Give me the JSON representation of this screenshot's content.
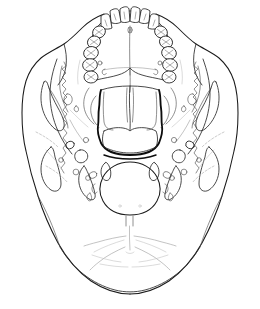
{
  "figure": {
    "title": "Human skull, inferior (basal) view",
    "view": "inferior",
    "style": "line-drawing",
    "background_color": "#ffffff",
    "line_color": "#1a1a1a",
    "accent_line_color": "#0d0d0d",
    "faint_line_color": "#9a9a9a",
    "width_px": 260,
    "height_px": 309,
    "labels_present": false,
    "caption": ""
  },
  "regions": [
    {
      "id": "dental-arch",
      "name": "Maxillary dental arch"
    },
    {
      "id": "hard-palate",
      "name": "Hard palate"
    },
    {
      "id": "choanae",
      "name": "Posterior nasal apertures (choanae)"
    },
    {
      "id": "vomer",
      "name": "Vomer"
    },
    {
      "id": "left-temporal",
      "name": "Left temporal region"
    },
    {
      "id": "right-temporal",
      "name": "Right temporal region"
    },
    {
      "id": "foramen-magnum",
      "name": "Foramen magnum"
    },
    {
      "id": "occipital-condyles",
      "name": "Occipital condyles"
    },
    {
      "id": "occipital-squama",
      "name": "Occipital squama with nuchal lines"
    }
  ],
  "dentition": {
    "arch": "maxillary",
    "total_teeth": 16,
    "left_quadrant": [
      {
        "position": 1,
        "name": "central incisor"
      },
      {
        "position": 2,
        "name": "lateral incisor"
      },
      {
        "position": 3,
        "name": "canine"
      },
      {
        "position": 4,
        "name": "first premolar"
      },
      {
        "position": 5,
        "name": "second premolar"
      },
      {
        "position": 6,
        "name": "first molar"
      },
      {
        "position": 7,
        "name": "second molar"
      },
      {
        "position": 8,
        "name": "third molar"
      }
    ],
    "right_quadrant": [
      {
        "position": 1,
        "name": "central incisor"
      },
      {
        "position": 2,
        "name": "lateral incisor"
      },
      {
        "position": 3,
        "name": "canine"
      },
      {
        "position": 4,
        "name": "first premolar"
      },
      {
        "position": 5,
        "name": "second premolar"
      },
      {
        "position": 6,
        "name": "first molar"
      },
      {
        "position": 7,
        "name": "second molar"
      },
      {
        "position": 8,
        "name": "third molar"
      }
    ]
  },
  "features": {
    "median_palatine_suture": "median palatine suture",
    "incisive_foramen": "incisive foramen",
    "greater_palatine_foramen": "greater palatine foramen",
    "posterior_nasal_spine": "posterior nasal spine",
    "foramen_ovale": "foramen ovale",
    "foramen_spinosum": "foramen spinosum",
    "carotid_canal": "carotid canal",
    "jugular_foramen": "jugular foramen",
    "stylomastoid_foramen": "stylomastoid foramen",
    "mandibular_fossa": "mandibular fossa",
    "mastoid_process": "mastoid process",
    "styloid_process": "styloid process",
    "occipital_condyle": "occipital condyle",
    "hypoglossal_canal": "hypoglossal canal",
    "pharyngeal_tubercle": "pharyngeal tubercle",
    "external_occipital_crest": "external occipital crest",
    "inferior_nuchal_line": "inferior nuchal line",
    "superior_nuchal_line": "superior nuchal line",
    "zygomatic_arch": "zygomatic arch"
  }
}
